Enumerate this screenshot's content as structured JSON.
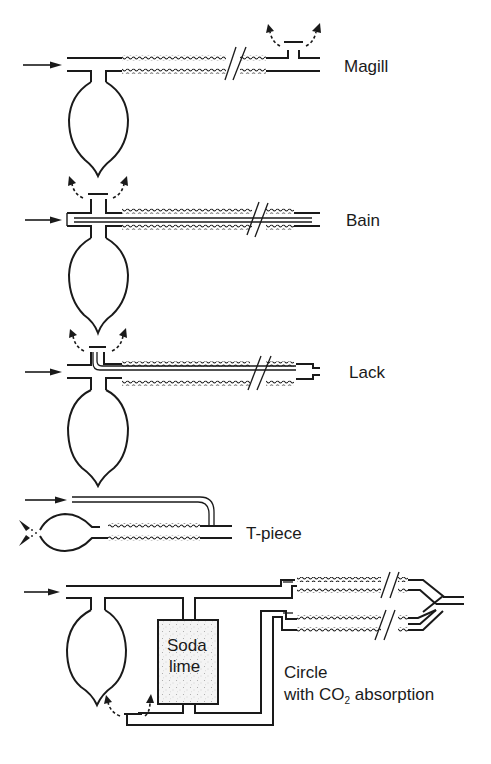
{
  "figure": {
    "colors": {
      "ink": "#1a1a1a",
      "background": "#ffffff",
      "soda_lime_fill": "#f2f2f2"
    }
  },
  "systems": [
    {
      "id": "magill",
      "label": "Magill"
    },
    {
      "id": "bain",
      "label": "Bain"
    },
    {
      "id": "lack",
      "label": "Lack"
    },
    {
      "id": "tpiece",
      "label": "T-piece"
    },
    {
      "id": "circle",
      "label_line1": "Circle",
      "label_line2_prefix": "with CO",
      "label_line2_sub": "2",
      "label_line2_suffix": " absorption"
    }
  ],
  "soda_lime": {
    "line1": "Soda",
    "line2": "lime"
  }
}
